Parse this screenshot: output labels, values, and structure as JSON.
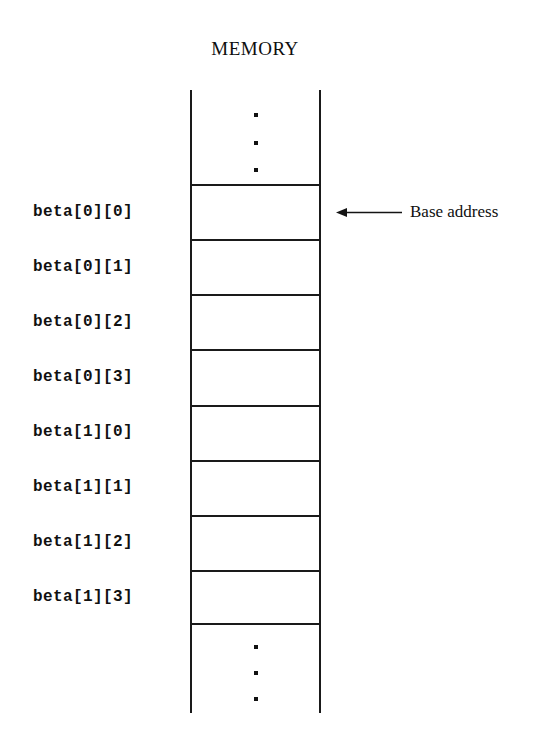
{
  "diagram": {
    "title": "MEMORY",
    "type": "memory-layout"
  },
  "memory_column": {
    "top_ellipsis": [
      "dot",
      "dot",
      "dot"
    ],
    "bottom_ellipsis": [
      "dot",
      "dot",
      "dot"
    ],
    "cells": [
      {
        "label": "beta[0][0]",
        "value": ""
      },
      {
        "label": "beta[0][1]",
        "value": ""
      },
      {
        "label": "beta[0][2]",
        "value": ""
      },
      {
        "label": "beta[0][3]",
        "value": ""
      },
      {
        "label": "beta[1][0]",
        "value": ""
      },
      {
        "label": "beta[1][1]",
        "value": ""
      },
      {
        "label": "beta[1][2]",
        "value": ""
      },
      {
        "label": "beta[1][3]",
        "value": ""
      }
    ]
  },
  "annotation": {
    "arrow_icon": "arrow-left-icon",
    "text": "Base address",
    "points_to_cell_index": 0
  },
  "colors": {
    "ink": "#111111",
    "line": "#1a1a1a",
    "background": "#ffffff"
  }
}
